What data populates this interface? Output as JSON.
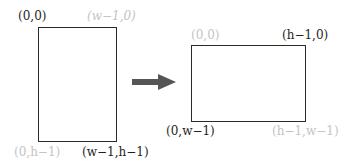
{
  "source": {
    "labels": {
      "top_left": "(0,0)",
      "top_right": "(w−1,0)",
      "bottom_left": "(0,h−1)",
      "bottom_right": "(w−1,h−1)"
    }
  },
  "target": {
    "labels": {
      "top_left": "(0,0)",
      "top_right": "(h−1,0)",
      "bottom_left": "(0,w−1)",
      "bottom_right": "(h−1,w−1)"
    }
  },
  "colors": {
    "stroke": "#2a2a2a",
    "arrow": "#555555",
    "faint_label": "#c4c4c4",
    "label": "#1e1e1e"
  }
}
